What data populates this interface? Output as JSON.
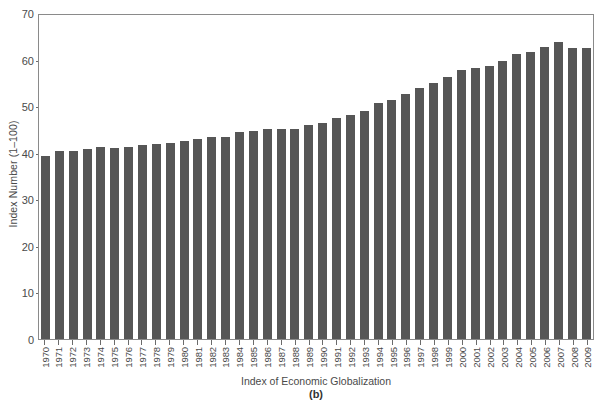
{
  "chart_data": {
    "type": "bar",
    "title": "",
    "caption": "(b)",
    "xlabel": "Index of Economic Globalization",
    "ylabel": "Index Number (1–100)",
    "ylim": [
      0,
      70
    ],
    "yticks": [
      0,
      10,
      20,
      30,
      40,
      50,
      60,
      70
    ],
    "grid": false,
    "legend": null,
    "bar_color": "#565656",
    "frame_color": "#8a8a8a",
    "categories": [
      "1970",
      "1971",
      "1972",
      "1973",
      "1974",
      "1975",
      "1976",
      "1977",
      "1978",
      "1979",
      "1980",
      "1981",
      "1982",
      "1983",
      "1984",
      "1985",
      "1986",
      "1987",
      "1988",
      "1989",
      "1990",
      "1991",
      "1992",
      "1993",
      "1994",
      "1995",
      "1996",
      "1997",
      "1998",
      "1999",
      "2000",
      "2001",
      "2002",
      "2003",
      "2004",
      "2005",
      "2006",
      "2007",
      "2008",
      "2009"
    ],
    "values": [
      39.4,
      40.4,
      40.4,
      40.8,
      41.2,
      41.0,
      41.2,
      41.6,
      41.8,
      42.0,
      42.6,
      43.0,
      43.4,
      43.4,
      44.4,
      44.6,
      45.0,
      45.0,
      45.2,
      46.0,
      46.4,
      47.4,
      48.2,
      49.0,
      50.6,
      51.4,
      52.6,
      54.0,
      55.0,
      56.2,
      57.8,
      58.2,
      58.6,
      59.6,
      61.2,
      61.6,
      62.6,
      63.8,
      62.4,
      62.4
    ]
  }
}
